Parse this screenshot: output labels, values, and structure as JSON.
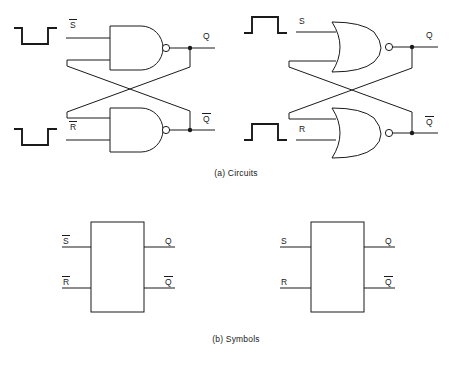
{
  "figure": {
    "captions": {
      "a": "(a) Circuits",
      "b": "(b) Symbols"
    },
    "line_color": "#1a1a1a",
    "background": "#ffffff"
  },
  "circuits": {
    "nand_latch": {
      "gate_type": "NAND",
      "logic_family": "active-low",
      "waveforms": [
        {
          "name": "s-bar-waveform",
          "polarity": "negative-pulse",
          "label": "S̅"
        },
        {
          "name": "r-bar-waveform",
          "polarity": "negative-pulse",
          "label": "R̅"
        }
      ],
      "inputs": [
        {
          "label": "S̅",
          "overbar": true,
          "base": "S"
        },
        {
          "label": "R̅",
          "overbar": true,
          "base": "R"
        }
      ],
      "outputs": [
        {
          "label": "Q",
          "overbar": false,
          "base": "Q"
        },
        {
          "label": "Q̅",
          "overbar": true,
          "base": "Q"
        }
      ]
    },
    "nor_latch": {
      "gate_type": "NOR",
      "logic_family": "active-high",
      "waveforms": [
        {
          "name": "s-waveform",
          "polarity": "positive-pulse",
          "label": "S"
        },
        {
          "name": "r-waveform",
          "polarity": "positive-pulse",
          "label": "R"
        }
      ],
      "inputs": [
        {
          "label": "S",
          "overbar": false,
          "base": "S"
        },
        {
          "label": "R",
          "overbar": false,
          "base": "R"
        }
      ],
      "outputs": [
        {
          "label": "Q",
          "overbar": false,
          "base": "Q"
        },
        {
          "label": "Q̅",
          "overbar": true,
          "base": "Q"
        }
      ]
    }
  },
  "symbols": {
    "nand_symbol": {
      "inputs": [
        {
          "label": "S̅",
          "overbar": true,
          "base": "S"
        },
        {
          "label": "R̅",
          "overbar": true,
          "base": "R"
        }
      ],
      "outputs": [
        {
          "label": "Q",
          "overbar": false,
          "base": "Q"
        },
        {
          "label": "Q̅",
          "overbar": true,
          "base": "Q"
        }
      ]
    },
    "nor_symbol": {
      "inputs": [
        {
          "label": "S",
          "overbar": false,
          "base": "S"
        },
        {
          "label": "R",
          "overbar": false,
          "base": "R"
        }
      ],
      "outputs": [
        {
          "label": "Q",
          "overbar": false,
          "base": "Q"
        },
        {
          "label": "Q̅",
          "overbar": true,
          "base": "Q"
        }
      ]
    }
  }
}
